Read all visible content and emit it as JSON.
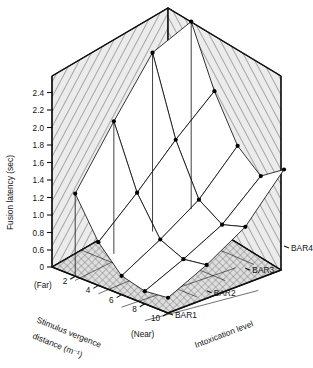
{
  "chart_data": {
    "type": "surface",
    "title": "",
    "xlabel": "Stimulus vergence distance (m⁻¹)",
    "ylabel": "Fusion latency (sec)",
    "zlabel": "Intoxication level",
    "x_far_label": "(Far)",
    "x_near_label": "(Near)",
    "x_ticks": [
      "2",
      "4",
      "6",
      "8",
      "10"
    ],
    "x_values": [
      2,
      4,
      6,
      8,
      10
    ],
    "y_ticks": [
      "0",
      "0.6",
      "0.8",
      "1.0",
      "1.2",
      "1.4",
      "1.6",
      "1.8",
      "2.0",
      "2.2",
      "2.4"
    ],
    "y_values": [
      0,
      0.6,
      0.8,
      1.0,
      1.2,
      1.4,
      1.6,
      1.8,
      2.0,
      2.2,
      2.4
    ],
    "ylim": [
      0,
      2.4
    ],
    "y_axis_break": true,
    "z_categories": [
      "BAR1",
      "BAR2",
      "BAR3",
      "BAR4"
    ],
    "grid": true,
    "legend": "none",
    "series": [
      {
        "name": "BAR1",
        "x": [
          2,
          4,
          6,
          8,
          10
        ],
        "values": [
          1.35,
          0.9,
          0.62,
          0.55,
          0.58
        ]
      },
      {
        "name": "BAR2",
        "x": [
          2,
          4,
          6,
          8,
          10
        ],
        "values": [
          1.92,
          1.21,
          0.78,
          0.66,
          0.7
        ]
      },
      {
        "name": "BAR3",
        "x": [
          2,
          4,
          6,
          8,
          10
        ],
        "values": [
          2.45,
          1.56,
          0.98,
          0.8,
          0.88
        ]
      },
      {
        "name": "BAR4",
        "x": [
          2,
          4,
          6,
          8,
          10
        ],
        "values": [
          2.55,
          1.86,
          1.34,
          1.1,
          1.28
        ]
      }
    ]
  },
  "axes": {
    "y_label": "Fusion latency (sec)",
    "x_label_line1": "Stimulus vergence",
    "x_label_line2": "distance (m⁻¹)",
    "z_label": "Intoxication level",
    "far": "(Far)",
    "near": "(Near)"
  },
  "ticks": {
    "y": [
      "24",
      "22",
      "20",
      "18",
      "16",
      "14",
      "12",
      "10",
      "08",
      "06",
      "0"
    ],
    "y_display": [
      "2.4",
      "2.2",
      "2.0",
      "1.8",
      "1.6",
      "1.4",
      "1.2",
      "1.0",
      "0.8",
      "0.6",
      "0"
    ],
    "x": [
      "2",
      "4",
      "6",
      "8",
      "10"
    ],
    "z": [
      "BAR1",
      "BAR2",
      "BAR3",
      "BAR4"
    ]
  },
  "colors": {
    "ink": "#111111",
    "wall_fill": "#e9e9e9",
    "hatch": "#555555",
    "surface_fill": "#ffffff",
    "marker": "#000000",
    "background": "#ffffff"
  }
}
